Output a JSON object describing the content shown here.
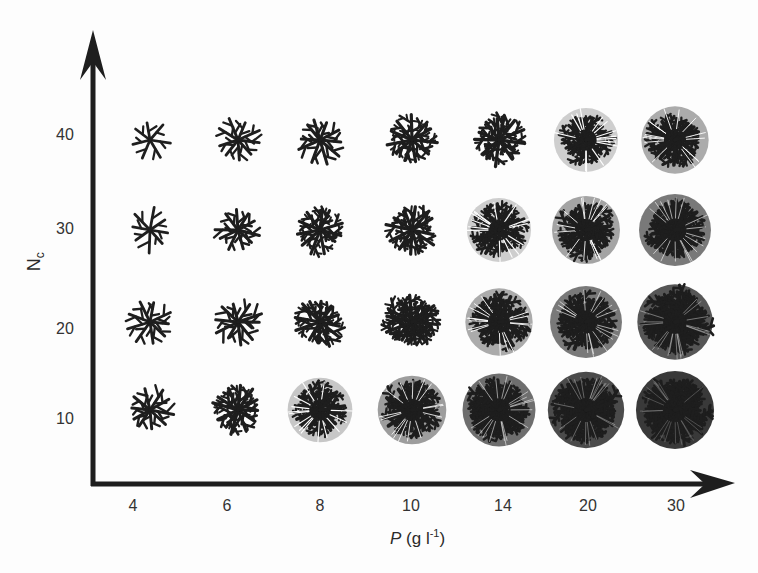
{
  "chart_data": {
    "type": "heatmap",
    "title": "",
    "xlabel": "P (g l^-1)",
    "xlabel_var": "P",
    "xlabel_unit": "(g l",
    "xlabel_exp": "-1",
    "xlabel_close": ")",
    "ylabel": "Nc",
    "ylabel_main": "N",
    "ylabel_sub": "c",
    "x_categories": [
      "4",
      "6",
      "8",
      "10",
      "14",
      "20",
      "30"
    ],
    "y_categories": [
      "10",
      "20",
      "30",
      "40"
    ],
    "cell_content": "branching colony pattern images; density increases with P and decreases with Nc",
    "density_matrix_rows_Nc_40_to_10": [
      [
        0.1,
        0.2,
        0.3,
        0.38,
        0.48,
        0.58,
        0.68
      ],
      [
        0.12,
        0.25,
        0.35,
        0.45,
        0.58,
        0.7,
        0.82
      ],
      [
        0.18,
        0.3,
        0.42,
        0.55,
        0.68,
        0.82,
        0.92
      ],
      [
        0.25,
        0.45,
        0.6,
        0.72,
        0.85,
        0.95,
        1.0
      ]
    ],
    "grid": false,
    "axes": "arrows"
  },
  "colors": {
    "ink": "#1e1e1e",
    "background": "#fdfdfd"
  }
}
